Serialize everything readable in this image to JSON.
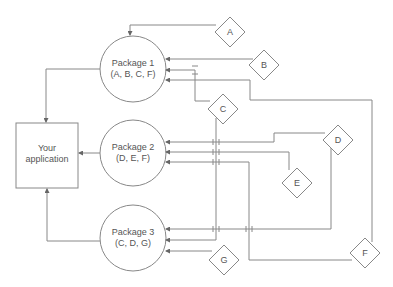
{
  "diagram": {
    "app": {
      "line1": "Your",
      "line2": "application"
    },
    "packages": [
      {
        "name": "Package 1",
        "deps": "(A, B, C, F)"
      },
      {
        "name": "Package 2",
        "deps": "(D, E, F)"
      },
      {
        "name": "Package 3",
        "deps": "(C, D, G)"
      }
    ],
    "dependencies": [
      "A",
      "B",
      "C",
      "D",
      "E",
      "F",
      "G"
    ],
    "colors": {
      "stroke": "#777777",
      "text": "#555555",
      "background": "#ffffff"
    }
  }
}
